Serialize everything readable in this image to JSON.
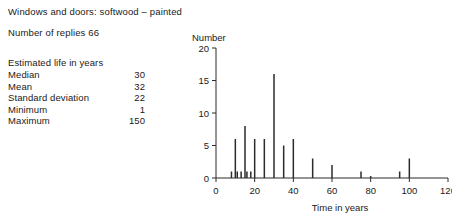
{
  "header": {
    "title": "Windows and doors: softwood – painted",
    "replies": "Number of replies 66"
  },
  "stats": {
    "heading": "Estimated life in years",
    "rows": [
      {
        "label": "Median",
        "value": "30"
      },
      {
        "label": "Mean",
        "value": "32"
      },
      {
        "label": "Standard deviation",
        "value": "22"
      },
      {
        "label": "Minimum",
        "value": "1"
      },
      {
        "label": "Maximum",
        "value": "150"
      }
    ]
  },
  "chart_data": {
    "type": "bar",
    "title": "",
    "xlabel": "Time in years",
    "ylabel": "Number",
    "xlim": [
      0,
      120
    ],
    "ylim": [
      0,
      20
    ],
    "xticks": [
      0,
      20,
      40,
      60,
      80,
      100,
      120
    ],
    "yticks": [
      0,
      5,
      10,
      15,
      20
    ],
    "xtick_labels": [
      "0",
      "20",
      "40",
      "60",
      "80",
      "100",
      "120"
    ],
    "ytick_labels": [
      "0",
      "5",
      "10",
      "15",
      "20"
    ],
    "grid": false,
    "legend": false,
    "x": [
      8,
      10,
      11,
      13,
      15,
      16,
      18,
      20,
      25,
      30,
      35,
      40,
      50,
      60,
      75,
      80,
      95,
      100
    ],
    "values": [
      1,
      6,
      1,
      1,
      8,
      1,
      1,
      6,
      6,
      16,
      5,
      6,
      3,
      2,
      1,
      0.3,
      1,
      3
    ]
  },
  "colors": {
    "ink": "#1a1a1a",
    "axis": "#2b2b2b",
    "bar": "#2b2b2b",
    "background": "#ffffff"
  }
}
